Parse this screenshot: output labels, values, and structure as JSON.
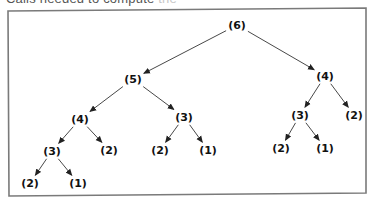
{
  "caption": {
    "visible": "Calls needed to compute",
    "faded": " the"
  },
  "tree": {
    "title": "Recursive call tree",
    "nodes": [
      {
        "id": "n6",
        "label": "(6)",
        "x": 237,
        "y": 25
      },
      {
        "id": "n5",
        "label": "(5)",
        "x": 133,
        "y": 79
      },
      {
        "id": "n4r",
        "label": "(4)",
        "x": 325,
        "y": 76
      },
      {
        "id": "n4l",
        "label": "(4)",
        "x": 80,
        "y": 119
      },
      {
        "id": "n3m",
        "label": "(3)",
        "x": 184,
        "y": 117
      },
      {
        "id": "n3r",
        "label": "(3)",
        "x": 300,
        "y": 115
      },
      {
        "id": "n2rr",
        "label": "(2)",
        "x": 354,
        "y": 115
      },
      {
        "id": "n3l",
        "label": "(3)",
        "x": 52,
        "y": 151
      },
      {
        "id": "n2l",
        "label": "(2)",
        "x": 109,
        "y": 150
      },
      {
        "id": "n2m",
        "label": "(2)",
        "x": 160,
        "y": 150
      },
      {
        "id": "n1m",
        "label": "(1)",
        "x": 208,
        "y": 150
      },
      {
        "id": "n2rl",
        "label": "(2)",
        "x": 281,
        "y": 148
      },
      {
        "id": "n1rl",
        "label": "(1)",
        "x": 325,
        "y": 148
      },
      {
        "id": "n2b",
        "label": "(2)",
        "x": 30,
        "y": 183
      },
      {
        "id": "n1b",
        "label": "(1)",
        "x": 78,
        "y": 183
      }
    ],
    "edges": [
      {
        "from": "n6",
        "to": "n5"
      },
      {
        "from": "n6",
        "to": "n4r"
      },
      {
        "from": "n5",
        "to": "n4l"
      },
      {
        "from": "n5",
        "to": "n3m"
      },
      {
        "from": "n4r",
        "to": "n3r"
      },
      {
        "from": "n4r",
        "to": "n2rr"
      },
      {
        "from": "n4l",
        "to": "n3l"
      },
      {
        "from": "n4l",
        "to": "n2l"
      },
      {
        "from": "n3m",
        "to": "n2m"
      },
      {
        "from": "n3m",
        "to": "n1m"
      },
      {
        "from": "n3r",
        "to": "n2rl"
      },
      {
        "from": "n3r",
        "to": "n1rl"
      },
      {
        "from": "n3l",
        "to": "n2b"
      },
      {
        "from": "n3l",
        "to": "n1b"
      }
    ]
  },
  "colors": {
    "border": "#7a7a7a",
    "edge": "#333333",
    "text": "#111111"
  }
}
